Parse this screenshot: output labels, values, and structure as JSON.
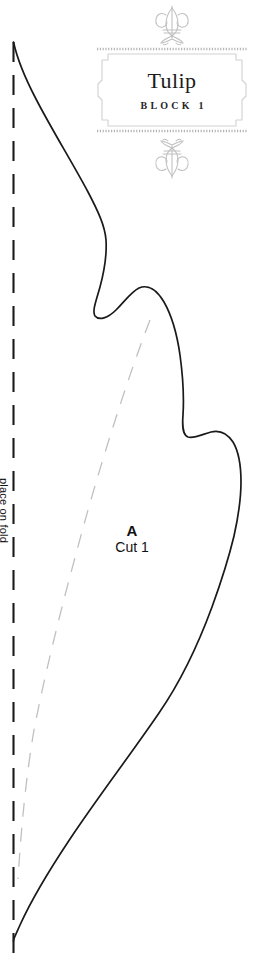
{
  "page": {
    "width": 256,
    "height": 975,
    "background": "#ffffff"
  },
  "label": {
    "title": "Tulip",
    "subtitle": "BLOCK 1",
    "ornament_top_name": "fleur-de-lis-ornament",
    "ornament_bottom_name": "fleur-de-lis-ornament-inverted",
    "border_color": "#b8b8b8",
    "text_color": "#1a1a1a"
  },
  "piece": {
    "letter": "A",
    "cut_instruction": "Cut 1",
    "fold_instruction": "place on fold"
  },
  "colors": {
    "cut_line": "#1a1a1a",
    "fold_line": "#1a1a1a",
    "seam_line": "#c0c0c0",
    "paper": "#ffffff"
  },
  "geometry": {
    "fold_line_x": 13,
    "fold_line_y_start": 42,
    "fold_line_y_end": 966,
    "fold_dash_pattern": "20 13",
    "seam_dash_pattern": "14 11",
    "cut_outline_path": "M 13.5 42 C 17 58 24 76 36 99 C 52 130 72 162 88 192 C 98 211 105 226 106 240 C 107 255 104 272 100 287 C 96 301 92 311 95 316 C 99 321 108 318 116 310 C 125 301 131 292 139 288 C 148 284 157 290 164 302 C 172 316 177 334 180 355 C 183 377 184 399 183 415 C 182 428 183 435 188 437 C 194 439 203 434 211 432 C 219 430 227 433 233 442 C 239 452 241 466 241 482 C 241 500 238 518 234 536 C 228 561 220 585 212 607 C 198 645 179 684 159 713 C 131 754 98 797 70 839 C 48 872 30 903 20 925 C 15 936 13 940 13.5 941",
    "seam_line_path": "M 150 320 C 130 372 108 440 88 510 C 68 582 48 658 34 730 C 26 776 21 830 18 879"
  }
}
